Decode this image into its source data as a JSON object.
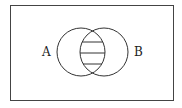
{
  "diagram": {
    "type": "venn",
    "sets": [
      {
        "label": "A"
      },
      {
        "label": "B"
      }
    ],
    "shaded_region": "A ∩ B",
    "shading_style": "horizontal-lines",
    "stroke_color": "#333333",
    "background": "#ffffff"
  }
}
